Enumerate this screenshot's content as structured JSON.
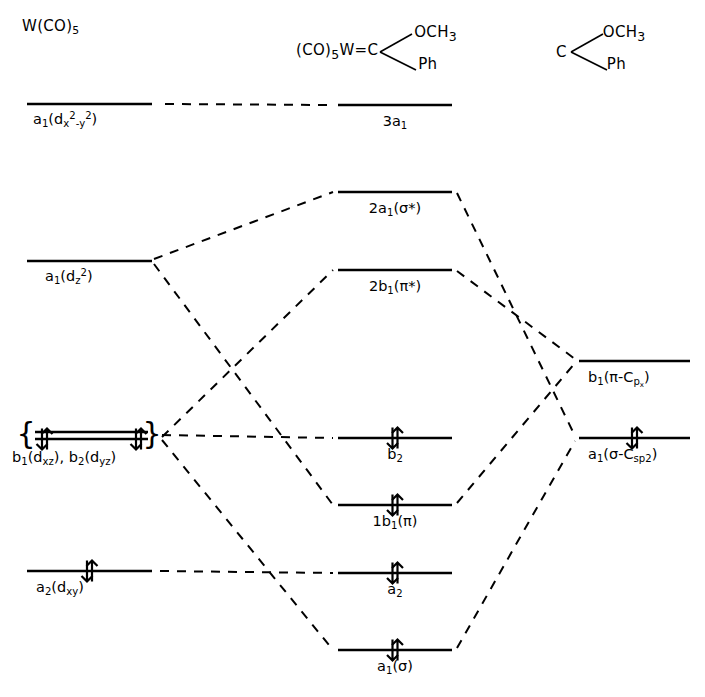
{
  "diagram": {
    "width": 705,
    "height": 697,
    "line_color": "#000000",
    "background": "#ffffff"
  },
  "fragments": {
    "left": {
      "name": "W(CO)5",
      "text_main": "W(CO)",
      "text_sub": "5"
    },
    "middle": {
      "name": "(CO)5W=C(OCH3)Ph",
      "prefix": "(CO)",
      "prefix_sub": "5",
      "metal": "W",
      "bond": "=",
      "carbon": "C",
      "substituent_top": "OCH",
      "substituent_top_sub": "3",
      "substituent_bottom": "Ph"
    },
    "right": {
      "name": "C(OCH3)Ph carbene",
      "carbon": "C",
      "substituent_top": "OCH",
      "substituent_top_sub": "3",
      "substituent_bottom": "Ph"
    }
  },
  "levels": {
    "left": [
      {
        "id": "a1-dx2y2",
        "label_html": "a<sub>1</sub>(d<sub>x</sub><sup>2</sup><sub>-y</sub><sup>2</sup>)",
        "label_plain": "a1(dx2-y2)",
        "x1": 27,
        "x2": 152,
        "y": 104,
        "label_x": 33,
        "label_y": 112,
        "electrons": 0
      },
      {
        "id": "a1-dz2",
        "label_html": "a<sub>1</sub>(d<sub>z</sub><sup>2</sup>)",
        "label_plain": "a1(dz2)",
        "x1": 27,
        "x2": 152,
        "y": 261,
        "label_x": 45,
        "label_y": 269,
        "electrons": 0
      },
      {
        "id": "b1-dxz-b2-dyz-upper",
        "label_html": "",
        "label_plain": "b1(dxz), b2(dyz) upper component",
        "x1": 35,
        "x2": 148,
        "y": 432,
        "label_x": 0,
        "label_y": 0,
        "electrons": 0
      },
      {
        "id": "b1-dxz-b2-dyz-lower",
        "label_html": "b<sub>1</sub>(d<sub>xz</sub>), b<sub>2</sub>(d<sub>yz</sub>)",
        "label_plain": "b1(dxz), b2(dyz)",
        "x1": 35,
        "x2": 148,
        "y": 439,
        "label_x": 12,
        "label_y": 450,
        "electrons": 4
      },
      {
        "id": "a2-dxy",
        "label_html": "a<sub>2</sub>(d<sub>xy</sub>)",
        "label_plain": "a2(dxy)",
        "x1": 27,
        "x2": 152,
        "y": 571,
        "label_x": 36,
        "label_y": 580,
        "electrons": 2
      }
    ],
    "middle": [
      {
        "id": "3a1",
        "label_html": "3a<sub>1</sub>",
        "label_plain": "3a1",
        "x1": 338,
        "x2": 452,
        "y": 105,
        "label_x": 395,
        "label_y": 114,
        "electrons": 0
      },
      {
        "id": "2a1-sigma-star",
        "label_html": "2a<sub>1</sub>(&#963;*)",
        "label_plain": "2a1(sigma*)",
        "x1": 338,
        "x2": 452,
        "y": 192,
        "label_x": 395,
        "label_y": 201,
        "electrons": 0
      },
      {
        "id": "2b1-pi-star",
        "label_html": "2b<sub>1</sub>(&#960;*)",
        "label_plain": "2b1(pi*)",
        "x1": 338,
        "x2": 452,
        "y": 270,
        "label_x": 395,
        "label_y": 279,
        "electrons": 0
      },
      {
        "id": "b2",
        "label_html": "b<sub>2</sub>",
        "label_plain": "b2",
        "x1": 338,
        "x2": 452,
        "y": 438,
        "label_x": 395,
        "label_y": 447,
        "electrons": 2
      },
      {
        "id": "1b1-pi",
        "label_html": "1b<sub>1</sub>(&#960;)",
        "label_plain": "1b1(pi)",
        "x1": 338,
        "x2": 452,
        "y": 505,
        "label_x": 395,
        "label_y": 514,
        "electrons": 2
      },
      {
        "id": "a2",
        "label_html": "a<sub>2</sub>",
        "label_plain": "a2",
        "x1": 338,
        "x2": 452,
        "y": 573,
        "label_x": 395,
        "label_y": 582,
        "electrons": 2
      },
      {
        "id": "a1-sigma",
        "label_html": "a<sub>1</sub>(&#963;)",
        "label_plain": "a1(sigma)",
        "x1": 338,
        "x2": 452,
        "y": 650,
        "label_x": 395,
        "label_y": 659,
        "electrons": 2
      }
    ],
    "right": [
      {
        "id": "b1-pi-Cpx",
        "label_html": "b<sub>1</sub>(&#960;-C<sub>p<sub>x</sub></sub>)",
        "label_plain": "b1(pi-Cpx)",
        "x1": 579,
        "x2": 690,
        "y": 361,
        "label_x": 588,
        "label_y": 370,
        "electrons": 0
      },
      {
        "id": "a1-sigma-Csp2",
        "label_html": "a<sub>1</sub>(&#963;-C<sub>sp2</sub>)",
        "label_plain": "a1(sigma-Csp2)",
        "x1": 579,
        "x2": 690,
        "y": 438,
        "label_x": 588,
        "label_y": 447,
        "electrons": 2
      }
    ]
  },
  "correlation_lines": [
    {
      "id": "dx2y2-to-3a1",
      "from": "a1-dx2y2",
      "to": "3a1",
      "x1": 165,
      "y1": 104,
      "x2": 330,
      "y2": 105
    },
    {
      "id": "dz2-to-2a1",
      "from": "a1-dz2",
      "to": "2a1-sigma-star",
      "x1": 154,
      "y1": 259,
      "x2": 333,
      "y2": 192
    },
    {
      "id": "dz2-to-1b1",
      "from": "a1-dz2",
      "to": "1b1-pi",
      "x1": 154,
      "y1": 264,
      "x2": 333,
      "y2": 505
    },
    {
      "id": "dpi-to-2b1",
      "from": "b1-dxz-b2-dyz",
      "to": "2b1-pi-star",
      "x1": 162,
      "y1": 437,
      "x2": 333,
      "y2": 270
    },
    {
      "id": "dpi-to-b2",
      "from": "b1-dxz-b2-dyz",
      "to": "b2",
      "x1": 162,
      "y1": 435,
      "x2": 333,
      "y2": 438
    },
    {
      "id": "dpi-to-a1sigma",
      "from": "b1-dxz-b2-dyz",
      "to": "a1-sigma",
      "x1": 162,
      "y1": 440,
      "x2": 333,
      "y2": 650
    },
    {
      "id": "dxy-to-a2",
      "from": "a2-dxy",
      "to": "a2",
      "x1": 160,
      "y1": 571,
      "x2": 333,
      "y2": 573
    },
    {
      "id": "2a1-to-asp2",
      "from": "2a1-sigma-star",
      "to": "a1-sigma-Csp2",
      "x1": 457,
      "y1": 193,
      "x2": 575,
      "y2": 436
    },
    {
      "id": "2b1-to-bpx",
      "from": "2b1-pi-star",
      "to": "b1-pi-Cpx",
      "x1": 457,
      "y1": 271,
      "x2": 575,
      "y2": 359
    },
    {
      "id": "1b1-to-bpx",
      "from": "1b1-pi",
      "to": "b1-pi-Cpx",
      "x1": 457,
      "y1": 503,
      "x2": 575,
      "y2": 363
    },
    {
      "id": "a1sigma-to-asp2",
      "from": "a1-sigma",
      "to": "a1-sigma-Csp2",
      "x1": 457,
      "y1": 648,
      "x2": 575,
      "y2": 441
    }
  ],
  "brace": {
    "left_symbol": "{",
    "right_symbol": "}",
    "left_x": 26,
    "right_x": 152,
    "y": 435
  },
  "electron_arrows": {
    "note": "paired spin-up / spin-down arrows",
    "up": "up-arrow",
    "down": "down-arrow"
  }
}
